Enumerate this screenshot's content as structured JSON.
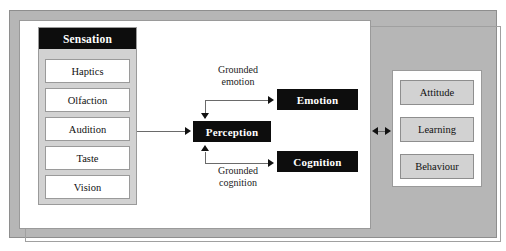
{
  "diagram": {
    "sensation": {
      "header_label": "Sensation",
      "modalities": [
        {
          "label": "Haptics"
        },
        {
          "label": "Olfaction"
        },
        {
          "label": "Audition"
        },
        {
          "label": "Taste"
        },
        {
          "label": "Vision"
        }
      ]
    },
    "processes": {
      "perception_label": "Perception",
      "emotion_label": "Emotion",
      "cognition_label": "Cognition"
    },
    "edge_labels": {
      "grounded_emotion_line1": "Grounded",
      "grounded_emotion_line2": "emotion",
      "grounded_cognition_line1": "Grounded",
      "grounded_cognition_line2": "cognition"
    },
    "outcomes": [
      {
        "label": "Attitude"
      },
      {
        "label": "Learning"
      },
      {
        "label": "Behaviour"
      }
    ],
    "colors": {
      "frame_gray": "#b6b6b6",
      "panel_white": "#ffffff",
      "box_black": "#0d0d0d",
      "box_gray": "#d2d2d2",
      "border_gray": "#9a9a9a",
      "line_gray": "#6a6a6a",
      "arrow_black": "#111111"
    }
  }
}
